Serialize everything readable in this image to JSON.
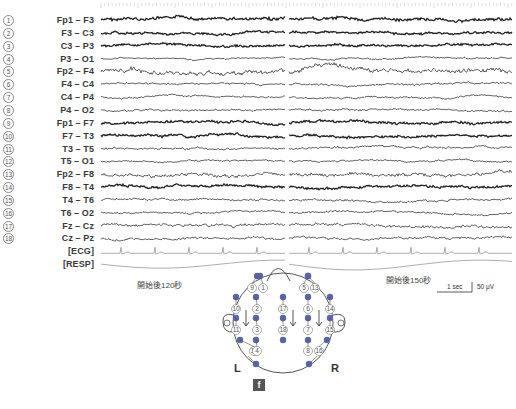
{
  "channels": [
    {
      "num": "1",
      "label": "Fp1 – F3"
    },
    {
      "num": "2",
      "label": "F3 – C3"
    },
    {
      "num": "3",
      "label": "C3 – P3"
    },
    {
      "num": "4",
      "label": "P3 – O1"
    },
    {
      "num": "5",
      "label": "Fp2 – F4"
    },
    {
      "num": "6",
      "label": "F4 – C4"
    },
    {
      "num": "7",
      "label": "C4 – P4"
    },
    {
      "num": "8",
      "label": "P4 – O2"
    },
    {
      "num": "9",
      "label": "Fp1 – F7"
    },
    {
      "num": "10",
      "label": "F7 – T3"
    },
    {
      "num": "11",
      "label": "T3 – T5"
    },
    {
      "num": "12",
      "label": "T5 – O1"
    },
    {
      "num": "13",
      "label": "Fp2 – F8"
    },
    {
      "num": "14",
      "label": "F8 – T4"
    },
    {
      "num": "15",
      "label": "T4 – T6"
    },
    {
      "num": "16",
      "label": "T6 – O2"
    },
    {
      "num": "17",
      "label": "Fz – Cz"
    },
    {
      "num": "18",
      "label": "Cz – Pz"
    }
  ],
  "extra_channels": [
    "[ECG]",
    "[RESP]"
  ],
  "captions": {
    "left_segment": "開始後120秒",
    "right_segment": "開始後150秒"
  },
  "scale_bar": {
    "time": "1 sec",
    "amplitude": "50 μV"
  },
  "head_diagram": {
    "left_label": "L",
    "right_label": "R",
    "electrode_color": "#5a64a8",
    "electrode_labels": [
      "9",
      "1",
      "5",
      "13",
      "10",
      "2",
      "17",
      "6",
      "14",
      "11",
      "3",
      "18",
      "7",
      "15",
      "12",
      "4",
      "8",
      "16"
    ]
  },
  "figure_label": "f"
}
